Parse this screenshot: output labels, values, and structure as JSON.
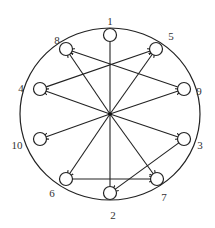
{
  "diagram": {
    "type": "directed-graph",
    "colors": {
      "stroke": "#222222",
      "background": "#ffffff",
      "label": "#333333"
    },
    "outer_ellipse": {
      "cx": 110,
      "cy": 114,
      "rx": 90,
      "ry": 86
    },
    "hub": {
      "x": 110,
      "y": 114
    },
    "nodes": [
      {
        "id": "1",
        "label": "1",
        "x": 110,
        "y": 35,
        "lx": 110,
        "ly": 22
      },
      {
        "id": "5",
        "label": "5",
        "x": 156,
        "y": 49,
        "lx": 171,
        "ly": 37
      },
      {
        "id": "9",
        "label": "9",
        "x": 184,
        "y": 89,
        "lx": 199,
        "ly": 92
      },
      {
        "id": "3",
        "label": "3",
        "x": 184,
        "y": 139,
        "lx": 200,
        "ly": 146
      },
      {
        "id": "7",
        "label": "7",
        "x": 157,
        "y": 179,
        "lx": 164,
        "ly": 198
      },
      {
        "id": "2",
        "label": "2",
        "x": 110,
        "y": 193,
        "lx": 113,
        "ly": 216
      },
      {
        "id": "6",
        "label": "6",
        "x": 66,
        "y": 179,
        "lx": 52,
        "ly": 194
      },
      {
        "id": "10",
        "label": "10",
        "x": 40,
        "y": 139,
        "lx": 17,
        "ly": 146
      },
      {
        "id": "4",
        "label": "4",
        "x": 40,
        "y": 89,
        "lx": 21,
        "ly": 89
      },
      {
        "id": "8",
        "label": "8",
        "x": 66,
        "y": 49,
        "lx": 57,
        "ly": 41
      }
    ],
    "edges": [
      {
        "from": "hub",
        "to": "1",
        "arrow": false
      },
      {
        "from": "hub",
        "to": "8",
        "arrow": true
      },
      {
        "from": "hub",
        "to": "5",
        "arrow": true
      },
      {
        "from": "hub",
        "to": "4",
        "arrow": true
      },
      {
        "from": "hub",
        "to": "9",
        "arrow": true
      },
      {
        "from": "hub",
        "to": "10",
        "arrow": true
      },
      {
        "from": "hub",
        "to": "3",
        "arrow": true
      },
      {
        "from": "hub",
        "to": "6",
        "arrow": true
      },
      {
        "from": "hub",
        "to": "7",
        "arrow": true
      },
      {
        "from": "hub",
        "to": "2",
        "arrow": false
      },
      {
        "from": "9",
        "to": "8",
        "arrow": true
      },
      {
        "from": "4",
        "to": "5",
        "arrow": true
      },
      {
        "from": "6",
        "to": "7",
        "arrow": true
      },
      {
        "from": "3",
        "to": "2",
        "arrow": true
      }
    ]
  }
}
